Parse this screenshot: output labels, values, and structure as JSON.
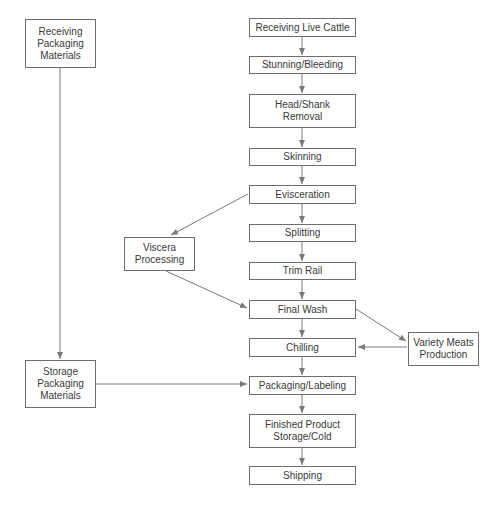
{
  "diagram": {
    "type": "flowchart",
    "colors": {
      "line": "#7a7a7a",
      "border": "#6e6e6e",
      "text": "#3a3a3a"
    },
    "nodes": {
      "receiving_packaging": "Receiving\nPackaging\nMaterials",
      "receiving_cattle": "Receiving Live Cattle",
      "stunning": "Stunning/Bleeding",
      "head_shank": "Head/Shank\nRemoval",
      "skinning": "Skinning",
      "evisceration": "Evisceration",
      "viscera": "Viscera\nProcessing",
      "splitting": "Splitting",
      "trim_rail": "Trim Rail",
      "final_wash": "Final Wash",
      "variety_meats": "Variety Meats\nProduction",
      "chilling": "Chilling",
      "storage_packaging": "Storage\nPackaging\nMaterials",
      "packaging_labeling": "Packaging/Labeling",
      "finished_storage": "Finished Product\nStorage/Cold",
      "shipping": "Shipping"
    },
    "edges": [
      [
        "Receiving Live Cattle",
        "Stunning/Bleeding"
      ],
      [
        "Stunning/Bleeding",
        "Head/Shank Removal"
      ],
      [
        "Head/Shank Removal",
        "Skinning"
      ],
      [
        "Skinning",
        "Evisceration"
      ],
      [
        "Evisceration",
        "Splitting"
      ],
      [
        "Evisceration",
        "Viscera Processing"
      ],
      [
        "Splitting",
        "Trim Rail"
      ],
      [
        "Trim Rail",
        "Final Wash"
      ],
      [
        "Viscera Processing",
        "Final Wash"
      ],
      [
        "Final Wash",
        "Chilling"
      ],
      [
        "Final Wash",
        "Variety Meats Production"
      ],
      [
        "Variety Meats Production",
        "Chilling"
      ],
      [
        "Chilling",
        "Packaging/Labeling"
      ],
      [
        "Receiving Packaging Materials",
        "Storage Packaging Materials"
      ],
      [
        "Storage Packaging Materials",
        "Packaging/Labeling"
      ],
      [
        "Packaging/Labeling",
        "Finished Product Storage/Cold"
      ],
      [
        "Finished Product Storage/Cold",
        "Shipping"
      ]
    ]
  }
}
